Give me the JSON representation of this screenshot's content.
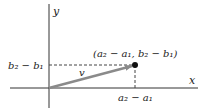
{
  "diagram": {
    "axes": {
      "x_label": "x",
      "y_label": "y"
    },
    "vector": {
      "label": "v",
      "color": "#8a8a8a"
    },
    "point": {
      "label": "(a₂ − a₁, b₂ − b₁)"
    },
    "y_tick_label": "b₂ − b₁",
    "x_tick_label": "a₂ − a₁",
    "colors": {
      "axis": "#333333",
      "dash": "#444444",
      "point": "#111111"
    }
  }
}
